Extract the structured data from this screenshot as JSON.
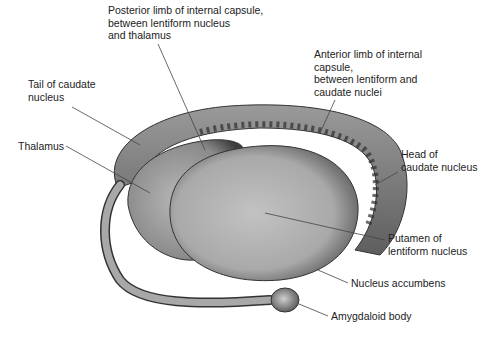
{
  "diagram": {
    "labels": [
      {
        "id": "posterior-limb",
        "text": "Posterior limb of internal capsule,\nbetween lentiform nucleus\nand thalamus",
        "x": 108,
        "y": 4
      },
      {
        "id": "anterior-limb",
        "text": "Anterior limb of internal\ncapsule,\nbetween lentiform and\ncaudate nuclei",
        "x": 314,
        "y": 48
      },
      {
        "id": "tail-caudate",
        "text": "Tail of caudate\nnucleus",
        "x": 28,
        "y": 78
      },
      {
        "id": "thalamus",
        "text": "Thalamus",
        "x": 18,
        "y": 140
      },
      {
        "id": "head-caudate",
        "text": "Head of\ncaudate nucleus",
        "x": 401,
        "y": 148
      },
      {
        "id": "putamen",
        "text": "Putamen of\nlentiform nucleus",
        "x": 388,
        "y": 232
      },
      {
        "id": "nucleus-accumbens",
        "text": "Nucleus accumbens",
        "x": 351,
        "y": 277
      },
      {
        "id": "amygdaloid-body",
        "text": "Amygdaloid body",
        "x": 331,
        "y": 310
      }
    ],
    "colors": {
      "shading_dark": "#3a3a3a",
      "shading_mid": "#8c8c8c",
      "shading_light": "#bdbdbd",
      "leader_line": "#444444"
    }
  }
}
